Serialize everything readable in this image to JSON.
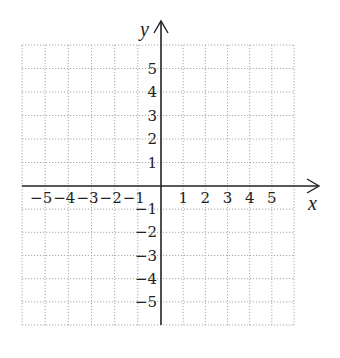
{
  "chart_data": {
    "type": "scatter",
    "title": "",
    "xlabel": "x",
    "ylabel": "y",
    "xlim": [
      -6,
      6
    ],
    "ylim": [
      -6,
      6
    ],
    "grid": true,
    "grid_style": "dotted",
    "x_ticks": [
      -5,
      -4,
      -3,
      -2,
      -1,
      1,
      2,
      3,
      4,
      5
    ],
    "y_ticks": [
      5,
      4,
      3,
      2,
      1,
      -1,
      -2,
      -3,
      -4,
      -5
    ],
    "x_tick_labels": [
      "−5",
      "−4",
      "−3",
      "−2",
      "−1",
      "1",
      "2",
      "3",
      "4",
      "5"
    ],
    "y_tick_labels": [
      "5",
      "4",
      "3",
      "2",
      "1",
      "−1",
      "−2",
      "−3",
      "−4",
      "−5"
    ],
    "series": [],
    "legend": null
  },
  "colors": {
    "axis": "#222222",
    "grid": "#a8a8a8",
    "text": "#222222"
  }
}
